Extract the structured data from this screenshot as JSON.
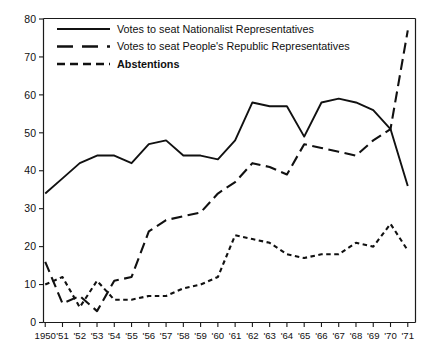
{
  "chart_data": {
    "type": "line",
    "title": "",
    "subtitle": "",
    "xlabel": "",
    "ylabel": "",
    "xlim": [
      1950,
      1971
    ],
    "ylim": [
      0,
      80
    ],
    "grid": false,
    "legend_position": "top-left",
    "categories": [
      "1950",
      "'51",
      "'52",
      "'53",
      "'54",
      "'55",
      "'56",
      "'57",
      "'58",
      "'59",
      "'60",
      "'61",
      "'62",
      "'63",
      "'64",
      "'65",
      "'66",
      "'67",
      "'68",
      "'69",
      "'70",
      "'71"
    ],
    "x": [
      1950,
      1951,
      1952,
      1953,
      1954,
      1955,
      1956,
      1957,
      1958,
      1959,
      1960,
      1961,
      1962,
      1963,
      1964,
      1965,
      1966,
      1967,
      1968,
      1969,
      1970,
      1971
    ],
    "yticks": [
      0,
      10,
      20,
      30,
      40,
      50,
      60,
      70,
      80
    ],
    "xticks": [
      "1950",
      "'51",
      "'52",
      "'53",
      "'54",
      "'55",
      "'56",
      "'57",
      "'58",
      "'59",
      "'60",
      "'61",
      "'62",
      "'63",
      "'64",
      "'65",
      "'66",
      "'67",
      "'68",
      "'69",
      "'70",
      "'71"
    ],
    "series": [
      {
        "name": "Votes to seat Nationalist Representatives",
        "style": "solid",
        "color": "#111111",
        "values": [
          34,
          38,
          42,
          44,
          44,
          42,
          47,
          48,
          44,
          44,
          43,
          48,
          58,
          57,
          57,
          49,
          58,
          59,
          58,
          56,
          51,
          36
        ]
      },
      {
        "name": "Votes to seat People's Republic Representatives",
        "style": "long-dash",
        "color": "#111111",
        "values": [
          16,
          5,
          7,
          3,
          11,
          12,
          24,
          27,
          28,
          29,
          34,
          37,
          42,
          41,
          39,
          47,
          46,
          45,
          44,
          48,
          51,
          77
        ]
      },
      {
        "name": "Abstentions",
        "style": "short-dash",
        "color": "#111111",
        "values": [
          10,
          12,
          4,
          11,
          6,
          6,
          7,
          7,
          9,
          10,
          12,
          23,
          22,
          21,
          18,
          17,
          18,
          18,
          21,
          20,
          26,
          19
        ]
      }
    ]
  },
  "legend": {
    "items": [
      {
        "label": "Votes to seat Nationalist Representatives",
        "style": "solid",
        "bold": false
      },
      {
        "label": "Votes to seat People's Republic Representatives",
        "style": "long-dash",
        "bold": false
      },
      {
        "label": "Abstentions",
        "style": "short-dash",
        "bold": true
      }
    ]
  },
  "colors": {
    "ink": "#111111",
    "background": "#ffffff"
  }
}
